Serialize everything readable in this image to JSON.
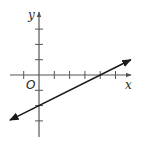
{
  "chart_data": {
    "type": "line",
    "title": "",
    "xlabel": "x",
    "ylabel": "y",
    "origin_label": "O",
    "xlim": [
      -1,
      6
    ],
    "ylim": [
      -4,
      4
    ],
    "x_ticks": [
      -1,
      1,
      2,
      3,
      4,
      5
    ],
    "y_ticks": [
      -3,
      -2,
      -1,
      1,
      2,
      3
    ],
    "tick_labels_shown": false,
    "grid": false,
    "legend": null,
    "series": [
      {
        "name": "line",
        "equation": "y = 0.5x - 2",
        "slope": 0.5,
        "intercept": -2,
        "x": [
          -2,
          6
        ],
        "y": [
          -3,
          1
        ],
        "key_points": [
          {
            "x": 0,
            "y": -2,
            "label": "y-intercept"
          },
          {
            "x": 4,
            "y": 0,
            "label": "x-intercept"
          }
        ],
        "arrows_both_ends": true,
        "color": "#1a1a1a"
      }
    ]
  },
  "colors": {
    "axis": "#555555",
    "line": "#1a1a1a",
    "background": "#ffffff"
  }
}
